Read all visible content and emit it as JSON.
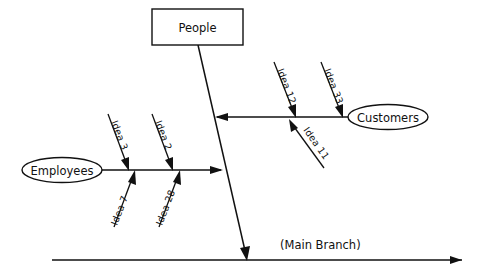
{
  "diagram": {
    "type": "fishbone-ishikawa",
    "title": "",
    "background_color": "#ffffff",
    "line_color": "#111111",
    "main_branch": {
      "label": "(Main Branch)",
      "label_x": 280,
      "label_y": 249,
      "x1": 52,
      "y1": 260,
      "x2": 462,
      "y2": 260,
      "arrow": "right"
    },
    "spine": {
      "label": "",
      "x1": 198,
      "y1": 45,
      "x2": 247,
      "y2": 260,
      "arrow": "down"
    },
    "nodes": [
      {
        "id": "people",
        "label": "People",
        "shape": "rect",
        "x": 152,
        "y": 9,
        "width": 91,
        "height": 36,
        "cx": 197.5,
        "cy": 27
      },
      {
        "id": "customers",
        "label": "Customers",
        "shape": "ellipse",
        "cx": 388,
        "cy": 117,
        "rx": 40,
        "ry": 12.5
      },
      {
        "id": "employees",
        "label": "Employees",
        "shape": "ellipse",
        "cx": 62,
        "cy": 170,
        "rx": 40,
        "ry": 12.5
      }
    ],
    "branches": [
      {
        "id": "customers-branch",
        "node": "customers",
        "x1": 348,
        "y1": 117,
        "x2": 215,
        "y2": 117,
        "arrow": "left"
      },
      {
        "id": "employees-branch",
        "node": "employees",
        "x1": 102,
        "y1": 170,
        "x2": 223,
        "y2": 170,
        "arrow": "right"
      }
    ],
    "sub_bones": [
      {
        "id": "idea-3",
        "label": "Idea 3",
        "branch": "employees-branch",
        "side": "above",
        "x1": 108,
        "y1": 114,
        "x2": 128,
        "y2": 168,
        "label_x": 111,
        "label_y": 122,
        "rotate": 69
      },
      {
        "id": "idea-2",
        "label": "Idea 2",
        "branch": "employees-branch",
        "side": "above",
        "x1": 152,
        "y1": 114,
        "x2": 172,
        "y2": 168,
        "label_x": 155,
        "label_y": 122,
        "rotate": 69
      },
      {
        "id": "idea-7",
        "label": "Idea 7",
        "branch": "employees-branch",
        "side": "below",
        "x1": 114,
        "y1": 227,
        "x2": 135,
        "y2": 172,
        "label_x": 119,
        "label_y": 228,
        "rotate": -69
      },
      {
        "id": "idea-28",
        "label": "Idea 28",
        "branch": "employees-branch",
        "side": "below",
        "x1": 158,
        "y1": 227,
        "x2": 180,
        "y2": 172,
        "label_x": 163,
        "label_y": 228,
        "rotate": -69
      },
      {
        "id": "idea-12",
        "label": "Idea 12",
        "branch": "customers-branch",
        "side": "above",
        "x1": 274,
        "y1": 62,
        "x2": 295,
        "y2": 115,
        "label_x": 277,
        "label_y": 70,
        "rotate": 69
      },
      {
        "id": "idea-33",
        "label": "Idea 33",
        "branch": "customers-branch",
        "side": "above",
        "x1": 321,
        "y1": 62,
        "x2": 342,
        "y2": 115,
        "label_x": 324,
        "label_y": 70,
        "rotate": 69
      },
      {
        "id": "idea-11",
        "label": "Idea 11",
        "branch": "customers-branch",
        "side": "below",
        "x1": 324,
        "y1": 168,
        "x2": 290,
        "y2": 120,
        "label_x": 305,
        "label_y": 133,
        "rotate": 55
      }
    ]
  }
}
